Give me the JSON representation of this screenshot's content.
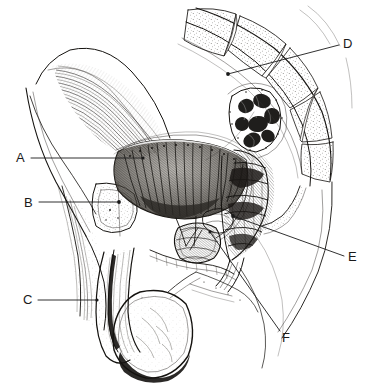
{
  "figure": {
    "style": "pen-and-ink anatomical engraving",
    "background_color": "#ffffff",
    "ink_color": "#14120f",
    "width": 370,
    "height": 391
  },
  "labels": [
    {
      "id": "A",
      "text": "A",
      "text_x": 16,
      "text_y": 162,
      "side": "left",
      "leader": {
        "x1": 31,
        "y1": 158,
        "x2": 143,
        "y2": 158
      },
      "marker": {
        "x": 143,
        "y": 158,
        "r": 1.6
      }
    },
    {
      "id": "B",
      "text": "B",
      "text_x": 24,
      "text_y": 207,
      "side": "left",
      "leader": {
        "x1": 39,
        "y1": 202,
        "x2": 119,
        "y2": 202
      },
      "marker": {
        "x": 119,
        "y": 202,
        "r": 1.9
      }
    },
    {
      "id": "C",
      "text": "C",
      "text_x": 23,
      "text_y": 304,
      "side": "left",
      "leader": {
        "x1": 38,
        "y1": 300,
        "x2": 97,
        "y2": 300
      },
      "marker": {
        "x": 97,
        "y": 300,
        "r": 1.6
      }
    },
    {
      "id": "D",
      "text": "D",
      "text_x": 343,
      "text_y": 48,
      "side": "right",
      "leader": {
        "x1": 339,
        "y1": 45,
        "x2": 228,
        "y2": 74
      },
      "marker": {
        "x": 228,
        "y": 74,
        "r": 1.9
      }
    },
    {
      "id": "E",
      "text": "E",
      "text_x": 348,
      "text_y": 261,
      "side": "right",
      "leader": {
        "x1": 344,
        "y1": 256,
        "x2": 233,
        "y2": 216
      },
      "marker": {
        "x": 233,
        "y": 216,
        "r": 1.9
      }
    },
    {
      "id": "F",
      "text": "F",
      "text_x": 282,
      "text_y": 342,
      "side": "right",
      "leader": {
        "x1": 280,
        "y1": 331,
        "x2": 210,
        "y2": 232
      },
      "marker": {
        "x": 210,
        "y": 232,
        "r": 1.6
      }
    }
  ],
  "structures": [
    {
      "name": "abdominal-wall-muscle",
      "label_ref": null
    },
    {
      "name": "urinary-bladder",
      "label_ref": "A"
    },
    {
      "name": "pubic-symphysis",
      "label_ref": "B"
    },
    {
      "name": "penis-corpus-cavernosum",
      "label_ref": "C"
    },
    {
      "name": "sacral-vertebrae",
      "label_ref": "D"
    },
    {
      "name": "rectum",
      "label_ref": "E"
    },
    {
      "name": "prostate-gland",
      "label_ref": "F"
    },
    {
      "name": "scrotum-testis",
      "label_ref": null
    },
    {
      "name": "sigmoid-colon",
      "label_ref": null
    },
    {
      "name": "coccyx",
      "label_ref": null
    }
  ]
}
